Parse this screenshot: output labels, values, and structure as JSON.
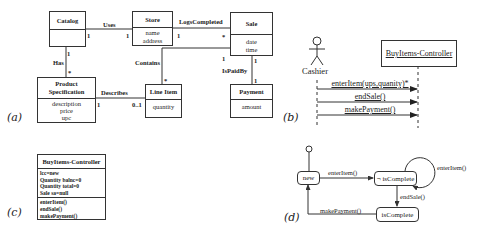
{
  "panels": {
    "a": "(a)",
    "b": "(b)",
    "c": "(c)",
    "d": "(d)"
  },
  "class_diagram": {
    "classes": [
      {
        "name": "Catalog",
        "attributes": []
      },
      {
        "name": "Store",
        "attributes": [
          "name",
          "address"
        ]
      },
      {
        "name": "Sale",
        "attributes": [
          "date",
          "time"
        ]
      },
      {
        "name": "Product Specification",
        "name_lines": [
          "Product",
          "Specification"
        ],
        "attributes": [
          "description",
          "price",
          "upc"
        ]
      },
      {
        "name": "Line Item",
        "attributes": [
          "quantity"
        ]
      },
      {
        "name": "Payment",
        "attributes": [
          "amount"
        ]
      }
    ],
    "associations": [
      {
        "label": "Uses",
        "from": "Catalog",
        "to": "Store",
        "from_mult": "1",
        "to_mult": "1"
      },
      {
        "label": "LogsCompleted",
        "from": "Store",
        "to": "Sale",
        "from_mult": "1",
        "to_mult": "*"
      },
      {
        "label": "Has",
        "from": "Catalog",
        "to": "Product Specification",
        "from_mult": "1",
        "to_mult": "*"
      },
      {
        "label": "Contains",
        "from": "Sale",
        "to": "Line Item",
        "from_mult": "1",
        "to_mult": "*"
      },
      {
        "label": "IsPaidBy",
        "from": "Sale",
        "to": "Payment",
        "from_mult": "1",
        "to_mult": "1"
      },
      {
        "label": "Describes",
        "from": "Product Specification",
        "to": "Line Item",
        "from_mult": "1",
        "to_mult": "0..1"
      }
    ]
  },
  "sequence_diagram": {
    "actor": "Cashier",
    "object": "BuyItems-Controller",
    "messages": [
      "enterItem(ups,quanity)*",
      "endSale()",
      "makePayment()"
    ]
  },
  "controller_class": {
    "name": "BuyItems-Controller",
    "attributes": [
      "lcc=new",
      "Quantity balnc=0",
      "Quantity total=0",
      "Sale sa=null"
    ],
    "operations": [
      "enterItem()",
      "endSale()",
      "makePayment()"
    ]
  },
  "state_diagram": {
    "states": [
      "new",
      "¬ isComplete",
      "isComplete"
    ],
    "transitions": [
      {
        "from": "new",
        "to": "¬ isComplete",
        "label": "enterItem()"
      },
      {
        "from": "¬ isComplete",
        "to": "¬ isComplete",
        "label": "enterItem()"
      },
      {
        "from": "¬ isComplete",
        "to": "isComplete",
        "label": "endSale()"
      },
      {
        "from": "isComplete",
        "to": "new",
        "label": "makePayment()"
      }
    ]
  }
}
